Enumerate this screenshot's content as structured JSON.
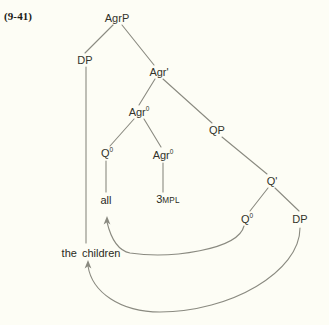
{
  "figure": {
    "example_number": "(9-41)",
    "kind": "syntax-tree",
    "background_color": "#fdfdf5",
    "line_color": "#8a8a80",
    "text_color": "#33332b"
  },
  "nodes": {
    "agrp": "AgrP",
    "dp_spec": "DP",
    "agr_bar": "Agr",
    "agr_bar_prime": "'",
    "agr_zero_upper": "Agr",
    "agr_zero_upper_sup": "0",
    "q_zero_left": "Q",
    "q_zero_left_sup": "0",
    "agr_zero_lower": "Agr",
    "agr_zero_lower_sup": "0",
    "qp": "QP",
    "q_bar": "Q",
    "q_bar_prime": "'",
    "q_zero_right": "Q",
    "q_zero_right_sup": "0",
    "dp_comp": "DP"
  },
  "terminals": {
    "all": "all",
    "agr_features_num": "3",
    "agr_features_smallcaps": "MPL",
    "the": "the",
    "children": "children"
  },
  "movement_arrows": [
    {
      "name": "q-head-movement",
      "from": "Q0 (complement of Q')",
      "to": "all (Q0 in Agr0)"
    },
    {
      "name": "dp-subject-raising",
      "from": "DP (complement of Q')",
      "to": "the children (Spec,AgrP)"
    }
  ]
}
